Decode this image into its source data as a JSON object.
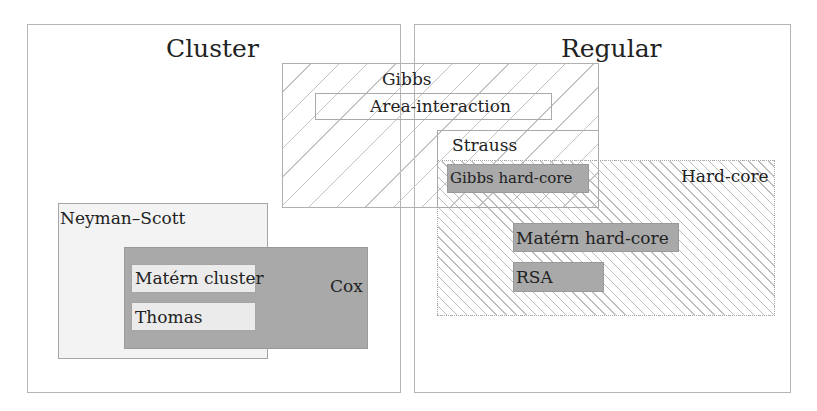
{
  "diagram": {
    "regions": {
      "cluster": {
        "label": "Cluster"
      },
      "regular": {
        "label": "Regular"
      },
      "gibbs": {
        "label": "Gibbs"
      },
      "area_interaction": {
        "label": "Area-interaction"
      },
      "strauss": {
        "label": "Strauss"
      },
      "gibbs_hard_core": {
        "label": "Gibbs hard-core"
      },
      "hard_core": {
        "label": "Hard-core"
      },
      "matern_hard_core": {
        "label": "Matérn hard-core"
      },
      "rsa": {
        "label": "RSA"
      },
      "neyman_scott": {
        "label": "Neyman–Scott"
      },
      "cox": {
        "label": "Cox"
      },
      "matern_cluster": {
        "label": "Matérn cluster"
      },
      "thomas": {
        "label": "Thomas"
      }
    },
    "colors": {
      "border": "#b5b5b5",
      "dark_fill": "#a9a9a9",
      "light_fill": "#ebebeb",
      "hatch": "#c4c4c4",
      "text": "#222222"
    }
  }
}
